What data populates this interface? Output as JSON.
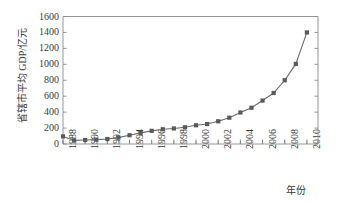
{
  "chart_data": {
    "type": "line",
    "title": "",
    "subtitle": "",
    "xlabel": "年份",
    "ylabel": "省辖市平均 GDP/亿元",
    "grid": false,
    "legend": "none",
    "marker": "square",
    "line_color": "#6b6b6b",
    "marker_color": "#5a5a5a",
    "axis_color": "#8a8a8a",
    "xlim": [
      1988,
      2011
    ],
    "ylim": [
      0,
      1600
    ],
    "y_tick_step": 200,
    "y_ticks": [
      0,
      200,
      400,
      600,
      800,
      1000,
      1200,
      1400,
      1600
    ],
    "y_tick_labels": [
      "0",
      "200",
      "400",
      "600",
      "800",
      "1000",
      "1200",
      "1400",
      "1600"
    ],
    "x_ticks": [
      1988,
      1990,
      1992,
      1994,
      1996,
      1998,
      2000,
      2002,
      2004,
      2006,
      2008,
      2010
    ],
    "x_tick_labels": [
      "1988",
      "1990",
      "1992",
      "1994",
      "1996",
      "1998",
      "2000",
      "2002",
      "2004",
      "2006",
      "2008",
      "2010"
    ],
    "x_minor_step": 1,
    "x": [
      1988,
      1989,
      1990,
      1991,
      1992,
      1993,
      1994,
      1995,
      1996,
      1997,
      1998,
      1999,
      2000,
      2001,
      2002,
      2003,
      2004,
      2005,
      2006,
      2007,
      2008,
      2009,
      2010
    ],
    "values": [
      95,
      45,
      50,
      55,
      62,
      80,
      110,
      140,
      165,
      185,
      195,
      210,
      235,
      250,
      285,
      330,
      395,
      455,
      545,
      640,
      800,
      1005,
      1400
    ],
    "series": [
      {
        "name": "省辖市平均 GDP",
        "values": [
          95,
          45,
          50,
          55,
          62,
          80,
          110,
          140,
          165,
          185,
          195,
          210,
          235,
          250,
          285,
          330,
          395,
          455,
          545,
          640,
          800,
          1005,
          1400
        ]
      }
    ]
  }
}
